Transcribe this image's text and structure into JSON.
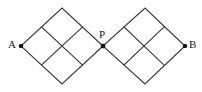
{
  "figure": {
    "background_color": "#ffffff",
    "line_color": "#3a3a3a",
    "dot_color": "#111111",
    "width": 202,
    "height": 92
  },
  "labels": {
    "a": "A",
    "p": "P",
    "b": "B"
  },
  "chart_data": {
    "type": "diagram",
    "nodes": [
      {
        "id": "A",
        "label": "A",
        "x": 21,
        "y": 46,
        "marker": "filled-dot",
        "label_position": "left"
      },
      {
        "id": "P",
        "label": "P",
        "x": 103,
        "y": 46,
        "marker": "filled-dot",
        "label_position": "above-left"
      },
      {
        "id": "B",
        "label": "B",
        "x": 185,
        "y": 46,
        "marker": "filled-dot",
        "label_position": "right"
      },
      {
        "id": "L_top",
        "label": "",
        "x": 62,
        "y": 8,
        "marker": "none",
        "label_position": "none"
      },
      {
        "id": "L_bottom",
        "label": "",
        "x": 62,
        "y": 84,
        "marker": "none",
        "label_position": "none"
      },
      {
        "id": "R_top",
        "label": "",
        "x": 145,
        "y": 8,
        "marker": "none",
        "label_position": "none"
      },
      {
        "id": "R_bottom",
        "label": "",
        "x": 145,
        "y": 84,
        "marker": "none",
        "label_position": "none"
      }
    ],
    "diamonds": [
      {
        "name": "left-diamond",
        "left": [
          21,
          46
        ],
        "top": [
          62,
          8
        ],
        "right": [
          103,
          46
        ],
        "bottom": [
          62,
          84
        ],
        "subdivisions": 2
      },
      {
        "name": "right-diamond",
        "left": [
          103,
          46
        ],
        "top": [
          145,
          8
        ],
        "right": [
          185,
          46
        ],
        "bottom": [
          145,
          84
        ],
        "subdivisions": 2
      }
    ],
    "left_outline": "21,46 62,8 103,46 62,84 21,46",
    "right_outline": "103,46 145,8 185,46 145,84 103,46",
    "left_grid_lines": [
      {
        "x1": 41.5,
        "y1": 27,
        "x2": 82.5,
        "y2": 65
      },
      {
        "x1": 41.5,
        "y1": 65,
        "x2": 82.5,
        "y2": 27
      }
    ],
    "right_grid_lines": [
      {
        "x1": 124,
        "y1": 27,
        "x2": 164,
        "y2": 65
      },
      {
        "x1": 124,
        "y1": 65,
        "x2": 164,
        "y2": 27
      }
    ],
    "xlabel": "",
    "ylabel": "",
    "legend": []
  }
}
